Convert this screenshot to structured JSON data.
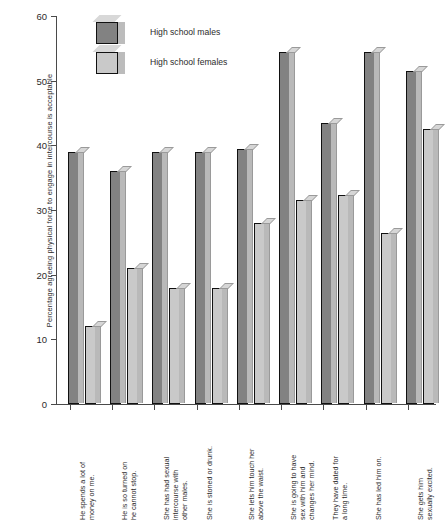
{
  "chart_data": {
    "type": "bar",
    "title": "",
    "xlabel": "",
    "ylabel": "Percentage agreeing physical force to engage in intercourse is acceptable",
    "ylim": [
      0,
      60
    ],
    "yticks": [
      0,
      10,
      20,
      30,
      40,
      50,
      60
    ],
    "grid": false,
    "legend_position": "top-center",
    "categories": [
      "He spends a lot of money on me.",
      "He is so turned on he cannot stop.",
      "She has had sexual intercourse with other males.",
      "She is stoned or drunk.",
      "She lets him touch her above the waist.",
      "She is going to have sex with him and changes her mind.",
      "They have dated for a long time.",
      "She has led him on.",
      "She gets him sexually excited."
    ],
    "category_lines": [
      [
        "He spends a lot of",
        "money on me."
      ],
      [
        "He is so turned on",
        "he cannot stop."
      ],
      [
        "She has had sexual",
        "intercourse with",
        "other males."
      ],
      [
        "She is stoned or drunk."
      ],
      [
        "She lets him touch her",
        "above the waist."
      ],
      [
        "She is going to have",
        "sex with him and",
        "changes her mind."
      ],
      [
        "They have dated for",
        "a long time."
      ],
      [
        "She has led him on."
      ],
      [
        "She gets him",
        "sexually excited."
      ]
    ],
    "series": [
      {
        "name": "High school males",
        "color": "#828282",
        "values": [
          39,
          36,
          39,
          39,
          39.5,
          54.5,
          43.5,
          54.5,
          51.5
        ]
      },
      {
        "name": "High school females",
        "color": "#c9c9c9",
        "values": [
          12,
          21,
          18,
          18,
          28,
          31.5,
          32.3,
          26.5,
          42.5
        ]
      }
    ]
  },
  "legend": {
    "items": [
      {
        "label": "High school males"
      },
      {
        "label": "High school females"
      }
    ]
  }
}
